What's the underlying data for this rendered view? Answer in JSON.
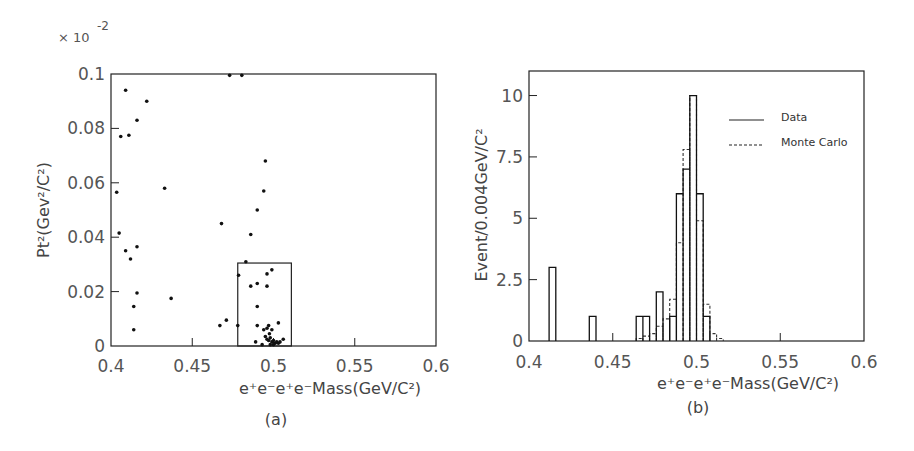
{
  "chart_data": [
    {
      "type": "scatter",
      "panel_label": "(a)",
      "multiplier_label": "× 10",
      "multiplier_exponent": "-2",
      "xlabel": "e+e-e+e-Mass(GeV/C²)",
      "ylabel": "Pt²(Gev²/C²)",
      "xlim": [
        0.4,
        0.6
      ],
      "ylim": [
        0,
        0.1
      ],
      "xticks": [
        "0.4",
        "0.45",
        "0.5",
        "0.55",
        "0.6"
      ],
      "yticks": [
        "0",
        "0.02",
        "0.04",
        "0.06",
        "0.08",
        "0.1"
      ],
      "signal_box": {
        "x": [
          0.478,
          0.511
        ],
        "y": [
          0,
          0.0305
        ]
      },
      "points": [
        [
          0.473,
          0.0995
        ],
        [
          0.4805,
          0.0995
        ],
        [
          0.409,
          0.094
        ],
        [
          0.422,
          0.09
        ],
        [
          0.416,
          0.083
        ],
        [
          0.406,
          0.077
        ],
        [
          0.411,
          0.0775
        ],
        [
          0.4035,
          0.0565
        ],
        [
          0.433,
          0.058
        ],
        [
          0.405,
          0.0415
        ],
        [
          0.409,
          0.035
        ],
        [
          0.412,
          0.032
        ],
        [
          0.416,
          0.0365
        ],
        [
          0.416,
          0.0195
        ],
        [
          0.414,
          0.0145
        ],
        [
          0.414,
          0.006
        ],
        [
          0.437,
          0.0175
        ],
        [
          0.495,
          0.068
        ],
        [
          0.494,
          0.057
        ],
        [
          0.49,
          0.05
        ],
        [
          0.468,
          0.045
        ],
        [
          0.486,
          0.041
        ],
        [
          0.483,
          0.031
        ],
        [
          0.4785,
          0.026
        ],
        [
          0.496,
          0.0265
        ],
        [
          0.499,
          0.028
        ],
        [
          0.486,
          0.022
        ],
        [
          0.49,
          0.023
        ],
        [
          0.496,
          0.022
        ],
        [
          0.49,
          0.0145
        ],
        [
          0.467,
          0.0075
        ],
        [
          0.471,
          0.0095
        ],
        [
          0.478,
          0.0075
        ],
        [
          0.49,
          0.0075
        ],
        [
          0.503,
          0.0085
        ],
        [
          0.494,
          0.006
        ],
        [
          0.496,
          0.0065
        ],
        [
          0.497,
          0.0075
        ],
        [
          0.499,
          0.006
        ],
        [
          0.4975,
          0.0045
        ],
        [
          0.495,
          0.0035
        ],
        [
          0.489,
          0.0015
        ],
        [
          0.493,
          0.0005
        ],
        [
          0.496,
          0.0025
        ],
        [
          0.497,
          0.002
        ],
        [
          0.498,
          0.003
        ],
        [
          0.499,
          0.0015
        ],
        [
          0.5,
          0.002
        ],
        [
          0.501,
          0.001
        ],
        [
          0.502,
          0.0015
        ],
        [
          0.503,
          0.001
        ],
        [
          0.504,
          0.0015
        ],
        [
          0.506,
          0.0025
        ],
        [
          0.5,
          0.0005
        ],
        [
          0.498,
          0.0005
        ]
      ]
    },
    {
      "type": "bar",
      "subtype": "histogram",
      "panel_label": "(b)",
      "xlabel": "e+e-e+e-Mass(GeV/C²)",
      "ylabel": "Event/0.004GeV/C²",
      "xlim": [
        0.4,
        0.6
      ],
      "ylim": [
        0,
        11
      ],
      "xticks": [
        "0.4",
        "0.45",
        "0.5",
        "0.55",
        "0.6"
      ],
      "yticks": [
        "0",
        "2.5",
        "5",
        "7.5",
        "10"
      ],
      "bin_width": 0.004,
      "legend": [
        {
          "label": "Data",
          "style": "solid"
        },
        {
          "label": "Monte Carlo",
          "style": "dashed"
        }
      ],
      "series": [
        {
          "name": "Data",
          "bins": [
            [
              0.412,
              3
            ],
            [
              0.436,
              1
            ],
            [
              0.464,
              1
            ],
            [
              0.468,
              1
            ],
            [
              0.476,
              2
            ],
            [
              0.484,
              1
            ],
            [
              0.488,
              6
            ],
            [
              0.492,
              7
            ],
            [
              0.496,
              10
            ],
            [
              0.5,
              6
            ],
            [
              0.504,
              1
            ]
          ]
        },
        {
          "name": "Monte Carlo",
          "bins": [
            [
              0.464,
              0.1
            ],
            [
              0.468,
              0.2
            ],
            [
              0.472,
              0.3
            ],
            [
              0.476,
              0.6
            ],
            [
              0.48,
              0.9
            ],
            [
              0.484,
              1.7
            ],
            [
              0.488,
              4.0
            ],
            [
              0.492,
              7.8
            ],
            [
              0.496,
              10.0
            ],
            [
              0.5,
              4.9
            ],
            [
              0.504,
              1.5
            ],
            [
              0.508,
              0.3
            ],
            [
              0.512,
              0.1
            ]
          ]
        }
      ]
    }
  ],
  "panels": {
    "a": {
      "caption": "(a)",
      "multiplier": "× 10",
      "exponent": "-2",
      "ylabel": "Pt²(Gev²/C²)",
      "xlabel": "e⁺e⁻e⁺e⁻Mass(GeV/C²)",
      "xticks": [
        "0.4",
        "0.45",
        "0.5",
        "0.55",
        "0.6"
      ],
      "yticks": [
        "0",
        "0.02",
        "0.04",
        "0.06",
        "0.08",
        "0.1"
      ]
    },
    "b": {
      "caption": "(b)",
      "ylabel": "Event/0.004GeV/C²",
      "xlabel": "e⁺e⁻e⁺e⁻Mass(GeV/C²)",
      "xticks": [
        "0.4",
        "0.45",
        "0.5",
        "0.55",
        "0.6"
      ],
      "yticks": [
        "0",
        "2.5",
        "5",
        "7.5",
        "10"
      ],
      "legend_data": "Data",
      "legend_mc": "Monte Carlo"
    }
  }
}
